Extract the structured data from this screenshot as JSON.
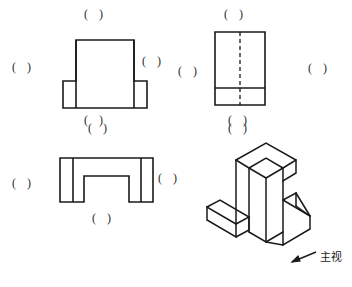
{
  "sheet": {
    "width": 352,
    "height": 287,
    "background": "#ffffff",
    "line_color": "#1a1a1a",
    "hidden_line_color": "#1a1a1a"
  },
  "blank_marks": [
    {
      "name": "blank-front-top",
      "label": "( )",
      "x": 84,
      "y": 8
    },
    {
      "name": "blank-front-left",
      "label": "( )",
      "x": 12,
      "y": 61
    },
    {
      "name": "blank-front-right",
      "label": "( )",
      "x": 142,
      "y": 55
    },
    {
      "name": "blank-front-bottom",
      "label": "( )",
      "x": 84,
      "y": 114
    },
    {
      "name": "blank-side-top",
      "label": "( )",
      "x": 224,
      "y": 8
    },
    {
      "name": "blank-side-left",
      "label": "( )",
      "x": 178,
      "y": 65
    },
    {
      "name": "blank-side-right",
      "label": "( )",
      "x": 308,
      "y": 62
    },
    {
      "name": "blank-side-bottom",
      "label": "( )",
      "x": 228,
      "y": 114
    },
    {
      "name": "blank-top-upper",
      "label": "( )",
      "x": 88,
      "y": 122
    },
    {
      "name": "blank-top-left",
      "label": "( )",
      "x": 12,
      "y": 177
    },
    {
      "name": "blank-top-right",
      "label": "( )",
      "x": 158,
      "y": 172
    },
    {
      "name": "blank-top-bottom",
      "label": "( )",
      "x": 92,
      "y": 212
    },
    {
      "name": "blank-iso-top",
      "label": "( )",
      "x": 228,
      "y": 122
    }
  ],
  "captions": [
    {
      "name": "main-view-direction-label",
      "label": "主视",
      "x": 320,
      "y": 258
    }
  ],
  "views": {
    "front_view": {
      "name": "front-view",
      "outline": "M 63,108 L 63,81 L 76,81 L 76,40 L 134,40 L 134,81 L 147,81 L 147,108 Z",
      "internal_lines": [
        "M 76,40 L 76,108",
        "M 134,40 L 134,108"
      ]
    },
    "side_view": {
      "name": "side-view",
      "outline": "M 215,32 L 265,32 L 265,105 L 215,105 Z",
      "internal_lines": [
        "M 215,88 L 265,88"
      ],
      "hidden_lines": [
        "M 240,32 L 240,105"
      ]
    },
    "top_view": {
      "name": "top-view",
      "outline": "M 60,158 L 153,158 L 153,202 L 129,202 L 129,176 L 84,176 L 84,202 L 60,202 Z",
      "internal_lines": [
        "M 73,158 L 73,202",
        "M 141,158 L 141,202"
      ]
    },
    "isometric_view": {
      "name": "isometric-pictorial-view",
      "edges": [
        "M 236,160 L 266,143 L 296,160 L 296,173 L 283,181 L 283,168 L 266,158 L 249,168 L 249,232",
        "M 236,160 L 236,224",
        "M 249,168 L 236,160",
        "M 283,168 L 296,160",
        "M 236,224 L 207,207 L 207,220 L 236,237 L 236,224",
        "M 207,207 L 220,200 L 249,217 L 236,224",
        "M 236,237 L 249,230 L 249,217",
        "M 249,232 L 266,242 L 266,178 L 283,168",
        "M 266,178 L 249,168",
        "M 266,242 L 283,232 L 283,181",
        "M 283,200 L 310,216 L 310,229 L 283,245 L 283,232",
        "M 296,193 L 310,216",
        "M 283,200 L 296,193 L 296,206",
        "M 296,206 L 310,216",
        "M 283,245 L 266,242"
      ]
    }
  },
  "arrow": {
    "name": "main-view-arrow",
    "path": "M 316,252 L 292,262",
    "head": "M 292,262 L 300,261 L 298,256 Z"
  }
}
